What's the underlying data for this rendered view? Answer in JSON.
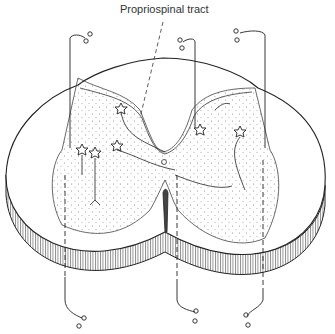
{
  "diagram": {
    "labels": [
      {
        "text": "Propriospinal tract",
        "target": "white matter tract adjacent to dorsal horn"
      }
    ],
    "elements": [
      "white matter",
      "grey matter (stippled)",
      "dorsal root fibers",
      "ventral fibers",
      "interneurons (star-shaped)",
      "central canal",
      "ventral fissure"
    ],
    "colors": {
      "line": "#222222",
      "stipple": "#888888",
      "background": "#ffffff"
    }
  }
}
